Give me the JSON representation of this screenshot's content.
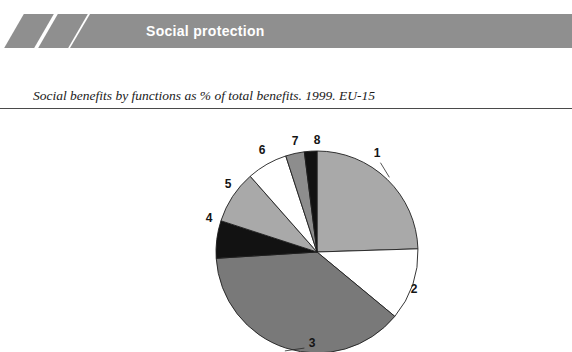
{
  "header": {
    "title": "Social protection",
    "band_color": "#8f8f8f",
    "title_color": "#ffffff",
    "slash_icon_1": "diagonal-slash",
    "slash_icon_2": "diagonal-slash"
  },
  "caption": {
    "text": "Social benefits by functions as % of total benefits. 1999. EU-15"
  },
  "chart_data": {
    "type": "pie",
    "title": "Social benefits by functions as % of total benefits. 1999. EU-15",
    "xlabel": "",
    "ylabel": "",
    "legend_position": "labels-outside",
    "grid": false,
    "categories": [
      "1",
      "2",
      "3",
      "4",
      "5",
      "6",
      "7",
      "8"
    ],
    "values": [
      24.5,
      11.5,
      38.0,
      6.0,
      8.5,
      6.5,
      3.0,
      2.0
    ],
    "colors": [
      "#a9a9a9",
      "#ffffff",
      "#797979",
      "#121212",
      "#a9a9a9",
      "#ffffff",
      "#8d8d8d",
      "#121212"
    ],
    "labels": [
      {
        "id": "1",
        "x": 377,
        "y": 45
      },
      {
        "id": "2",
        "x": 414,
        "y": 181
      },
      {
        "id": "3",
        "x": 312,
        "y": 235
      },
      {
        "id": "4",
        "x": 209,
        "y": 110
      },
      {
        "id": "5",
        "x": 228,
        "y": 76
      },
      {
        "id": "6",
        "x": 262,
        "y": 42
      },
      {
        "id": "7",
        "x": 295,
        "y": 33
      },
      {
        "id": "8",
        "x": 317,
        "y": 32
      }
    ]
  }
}
